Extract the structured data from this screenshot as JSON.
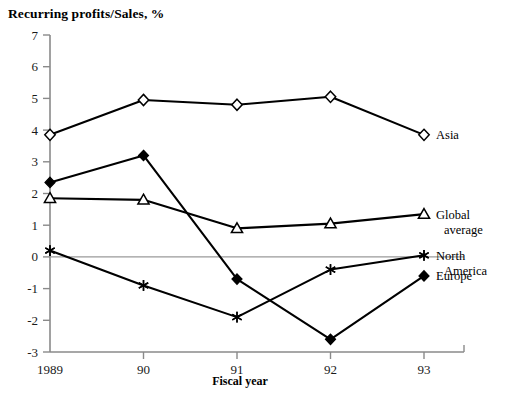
{
  "chart_data": {
    "type": "line",
    "title": "Recurring profits/Sales, %",
    "xlabel": "Fiscal year",
    "ylabel": "",
    "categories": [
      "1989",
      "90",
      "91",
      "92",
      "93"
    ],
    "x_tick_labels": [
      "1989",
      "90",
      "91",
      "92",
      "93"
    ],
    "y_tick_labels": [
      "7",
      "6",
      "5",
      "4",
      "3",
      "2",
      "1",
      "0",
      "-1",
      "-2",
      "-3"
    ],
    "y_ticks": [
      7,
      6,
      5,
      4,
      3,
      2,
      1,
      0,
      -1,
      -2,
      -3
    ],
    "ylim": [
      -3,
      7
    ],
    "grid": false,
    "zero_line": true,
    "legend_position": "right-inline",
    "series": [
      {
        "name": "Asia",
        "label": "Asia",
        "label_lines": [
          "Asia"
        ],
        "marker": "open-diamond",
        "color": "#000000",
        "values": [
          3.85,
          4.95,
          4.8,
          5.05,
          3.85
        ]
      },
      {
        "name": "Global average",
        "label": "Global average",
        "label_lines": [
          "Global",
          "average"
        ],
        "marker": "open-triangle",
        "color": "#000000",
        "values": [
          1.85,
          1.8,
          0.9,
          1.05,
          1.35
        ]
      },
      {
        "name": "North America",
        "label": "North America",
        "label_lines": [
          "North",
          "America"
        ],
        "marker": "asterisk",
        "color": "#000000",
        "values": [
          0.2,
          -0.9,
          -1.9,
          -0.4,
          0.05
        ]
      },
      {
        "name": "Europe",
        "label": "Europe",
        "label_lines": [
          "Europe"
        ],
        "marker": "filled-diamond",
        "color": "#000000",
        "values": [
          2.35,
          3.2,
          -0.7,
          -2.6,
          -0.6
        ]
      }
    ]
  },
  "axes": {
    "x_axis_title": "Fiscal year",
    "tick_color": "#8a8a8a",
    "axis_color": "#8a8a8a",
    "zero_line_color": "#9a9a9a"
  }
}
